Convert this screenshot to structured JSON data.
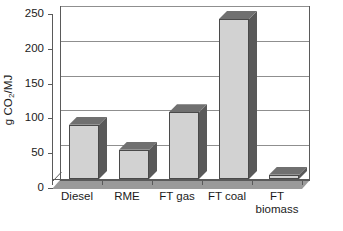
{
  "chart_data": {
    "type": "bar",
    "title": "",
    "xlabel": "",
    "ylabel": "g CO2/MJ",
    "ylabel_parts": {
      "prefix": "g CO",
      "sub": "2",
      "suffix": "/MJ"
    },
    "categories": [
      "Diesel",
      "RME",
      "FT gas",
      "FT coal",
      "FT biomass"
    ],
    "values": [
      78,
      42,
      96,
      230,
      6
    ],
    "ylim": [
      0,
      250
    ],
    "yticks": [
      0,
      50,
      100,
      150,
      200,
      250
    ],
    "ytick_labels": [
      "0",
      "50",
      "100",
      "150",
      "200",
      "250"
    ],
    "grid": true,
    "legend": false,
    "style_3d": true,
    "colors": {
      "bar_front": "#d2d2d2",
      "bar_side": "#595959",
      "bar_top": "#707070",
      "axis": "#5a5a5a",
      "gridline": "#8f8f8f",
      "floor": "#9a9a9a",
      "text": "#1b1b1b",
      "background": "#ffffff"
    }
  },
  "x_labels": [
    {
      "text": "Diesel"
    },
    {
      "text": "RME"
    },
    {
      "text": "FT gas"
    },
    {
      "text": "FT coal"
    },
    {
      "text": "FT\nbiomass"
    }
  ]
}
